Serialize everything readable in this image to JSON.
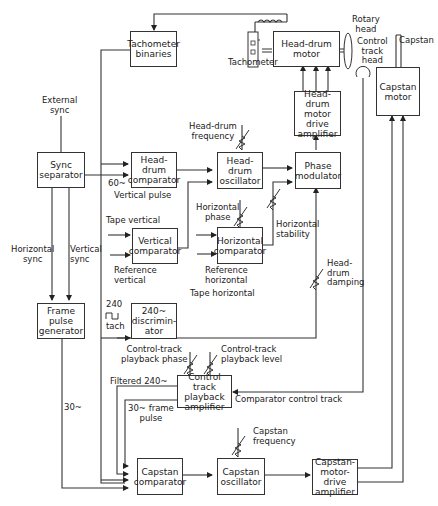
{
  "diagram": {
    "blocks": {
      "tachometer_binaries": "Tachometer\nbinaries",
      "sync_separator": "Sync\nseparator",
      "head_drum_comparator": "Head-\ndrum\ncomparator",
      "head_drum_oscillator": "Head-drum\noscillator",
      "phase_modulator": "Phase\nmodulator",
      "head_drum_motor": "Head-drum\nmotor",
      "head_drum_motor_drive_amplifier": "Head-drum\nmotor\ndrive\namplifier",
      "capstan_motor": "Capstan\nmotor",
      "vertical_comparator": "Vertical\ncomparator",
      "horizontal_comparator": "Horizontal\ncomparator",
      "frame_pulse_generator": "Frame\npulse\ngenerator",
      "discriminator": "240~\ndiscrimin-\nator",
      "control_track_playback_amplifier": "Control\ntrack\nplayback\namplifier",
      "capstan_comparator": "Capstan\ncomparator",
      "capstan_oscillator": "Capstan\noscillator",
      "capstan_motor_drive_amplifier": "Capstan-\nmotor-\ndrive\namplifier"
    },
    "labels": {
      "external_sync": "External\nsync",
      "tachometer": "Tachometer",
      "rotary_head": "Rotary\nhead",
      "control_track_head": "Control\ntrack\nhead",
      "capstan": "Capstan",
      "head_drum_frequency": "Head-drum\nfrequency",
      "sixty_hz": "60~",
      "vertical_pulse": "Vertical pulse",
      "horizontal_phase": "Horizontal\nphase",
      "horizontal_stability": "Horizontal\nstability",
      "tape_vertical": "Tape vertical",
      "reference_vertical": "Reference\nvertical",
      "reference_horizontal": "Reference\nhorizontal",
      "tape_horizontal": "Tape horizontal",
      "horizontal_sync": "Horizontal\nsync",
      "vertical_sync": "Vertical\nsync",
      "head_drum_damping": "Head-\ndrum\ndamping",
      "tach_240": "240",
      "tach": "tach",
      "control_track_playback_phase": "Control-track\nplayback phase",
      "control_track_playback_level": "Control-track\nplayback level",
      "filtered_240": "Filtered 240~",
      "thirty_hz": "30~",
      "thirty_hz_frame_pulse": "30~ frame\npulse",
      "comparator_control_track": "Comparator  control track",
      "capstan_frequency": "Capstan\nfrequency"
    }
  }
}
